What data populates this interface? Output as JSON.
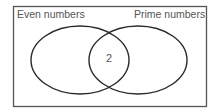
{
  "diagram": {
    "type": "venn",
    "sets": [
      {
        "label": "Even numbers",
        "only_elements": []
      },
      {
        "label": "Prime numbers",
        "only_elements": []
      }
    ],
    "intersection": {
      "elements": [
        "2"
      ],
      "text": "2"
    },
    "colors": {
      "stroke": "#2a2a2a",
      "label": "#555555",
      "frame": "#555555"
    }
  }
}
